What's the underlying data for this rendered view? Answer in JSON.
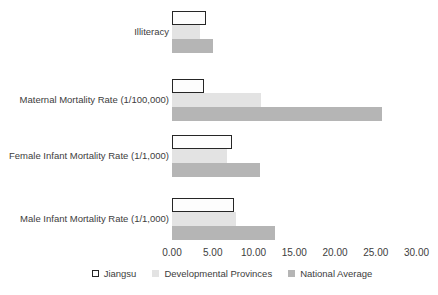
{
  "chart_data": {
    "type": "bar",
    "orientation": "horizontal",
    "title": "",
    "categories": [
      "Illiteracy",
      "Maternal Mortality Rate (1/100,000)",
      "Female Infant Mortality Rate (1/1,000)",
      "Male Infant Mortality Rate (1/1,000)"
    ],
    "series": [
      {
        "name": "Jiangsu",
        "values": [
          4.2,
          3.9,
          7.4,
          7.6
        ],
        "fill": "#fdfdfd",
        "border": "#262626"
      },
      {
        "name": "Developmental Provinces",
        "values": [
          3.4,
          10.9,
          6.8,
          7.9
        ],
        "fill": "#e3e3e3",
        "border": null
      },
      {
        "name": "National Average",
        "values": [
          5.0,
          25.8,
          10.8,
          12.6
        ],
        "fill": "#b5b5b5",
        "border": null
      }
    ],
    "x_axis": {
      "min": 0,
      "max": 30,
      "tick_step": 5,
      "tick_labels": [
        "0.00",
        "5.00",
        "10.00",
        "15.00",
        "20.00",
        "25.00",
        "30.00"
      ]
    },
    "legend": {
      "position": "bottom",
      "entries": [
        "Jiangsu",
        "Developmental Provinces",
        "National Average"
      ]
    },
    "grid": false,
    "colors": {
      "text": "#3d3d3d",
      "jiangsu_fill": "#fdfdfd",
      "jiangsu_border": "#262626",
      "developmental_provinces_fill": "#e3e3e3",
      "national_average_fill": "#b5b5b5",
      "background": "#ffffff"
    }
  }
}
